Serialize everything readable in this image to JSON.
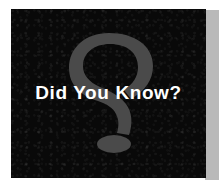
{
  "banner": {
    "headline": "Did You Know?",
    "watermark_icon": "question-mark-icon",
    "colors": {
      "panel_background": "#090909",
      "accent_strip": "#b9b9b9",
      "headline_text": "#ffffff",
      "watermark": "#4a4a4a",
      "page_background": "#ffffff"
    }
  }
}
